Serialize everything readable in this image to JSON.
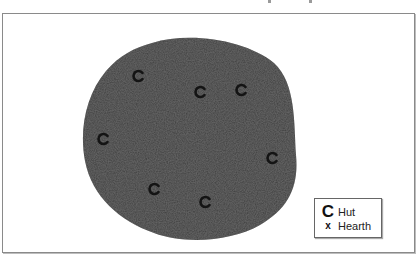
{
  "map": {
    "site_color": "#3c3c3c",
    "hut_color": "#141414",
    "huts": [
      {
        "x": 138,
        "y": 76
      },
      {
        "x": 200,
        "y": 92
      },
      {
        "x": 241,
        "y": 90
      },
      {
        "x": 103,
        "y": 139
      },
      {
        "x": 272,
        "y": 158
      },
      {
        "x": 154,
        "y": 189
      },
      {
        "x": 205,
        "y": 202
      }
    ]
  },
  "legend": {
    "items": [
      {
        "symbol": "C",
        "label": "Hut"
      },
      {
        "symbol": "x",
        "label": "Hearth"
      }
    ]
  }
}
